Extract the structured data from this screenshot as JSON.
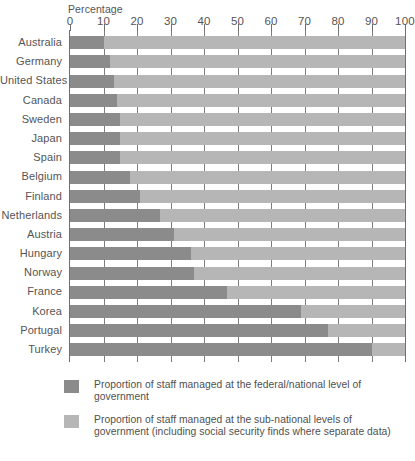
{
  "chart_data": {
    "type": "bar",
    "orientation": "horizontal",
    "stacked": true,
    "title": "",
    "xlabel": "Percentage",
    "ylabel": "",
    "xlim": [
      0,
      100
    ],
    "grid": true,
    "legend_position": "bottom",
    "tick_labels": [
      "0",
      "10",
      "20",
      "30",
      "40",
      "50",
      "60",
      "70",
      "80",
      "90",
      "100"
    ],
    "ticks": [
      0,
      10,
      20,
      30,
      40,
      50,
      60,
      70,
      80,
      90,
      100
    ],
    "categories": [
      "Australia",
      "Germany",
      "United States",
      "Canada",
      "Sweden",
      "Japan",
      "Spain",
      "Belgium",
      "Finland",
      "Netherlands",
      "Austria",
      "Hungary",
      "Norway",
      "France",
      "Korea",
      "Portugal",
      "Turkey"
    ],
    "series": [
      {
        "name": "Proportion of staff managed at the federal/national level of government",
        "color": "#8b8b8b",
        "values": [
          10,
          12,
          13,
          14,
          15,
          15,
          15,
          18,
          21,
          27,
          31,
          36,
          37,
          47,
          69,
          77,
          90
        ]
      },
      {
        "name": "Proportion of staff managed at the sub-national levels of government (including social security finds where separate data)",
        "color": "#b6b6b6",
        "values": [
          90,
          88,
          87,
          86,
          85,
          85,
          85,
          82,
          79,
          73,
          69,
          64,
          63,
          53,
          31,
          23,
          10
        ]
      }
    ]
  },
  "legend": {
    "items": [
      {
        "color": "#8b8b8b",
        "label": "Proportion of staff managed at the federal/national level of government"
      },
      {
        "color": "#b6b6b6",
        "label": "Proportion of staff managed at the sub-national levels of government (including social security finds where separate data)"
      }
    ]
  },
  "colors": {
    "federal": "#8b8b8b",
    "sub_national": "#b6b6b6",
    "gridline": "#7d7d7d",
    "text": "#555555",
    "background": "#ffffff"
  }
}
